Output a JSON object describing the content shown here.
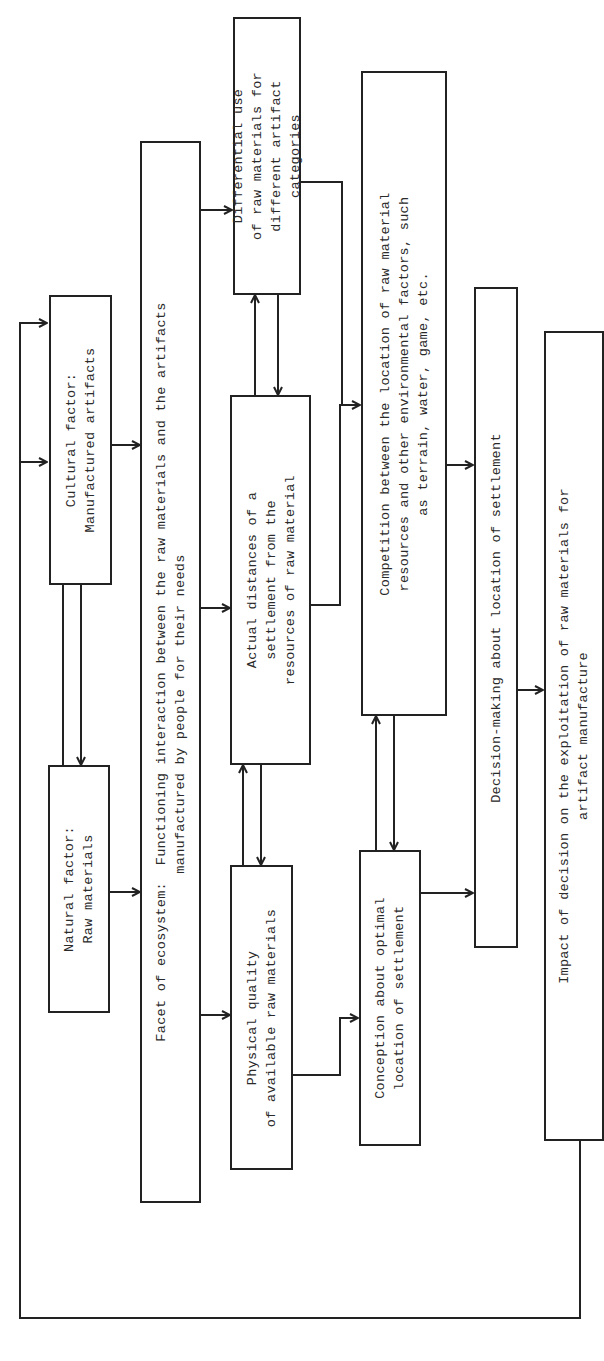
{
  "diagram": {
    "orientation": "rotated-90-ccw",
    "boxes": {
      "natural": {
        "label": "Natural factor:\nRaw materials"
      },
      "cultural": {
        "label": "Cultural factor:\nManufactured artifacts"
      },
      "facet": {
        "label": "Facet of ecosystem:  Functioning interaction between the raw materials and the artifacts\n                    manufactured by people for their needs"
      },
      "physical": {
        "label": "Physical quality\nof available raw materials"
      },
      "distances": {
        "label": "Actual distances of a\nsettlement from the\nresources of raw material"
      },
      "differential": {
        "label": "Differential use\nof raw materials for\ndifferent artifact\ncategories"
      },
      "conception": {
        "label": "Conception about optimal\nlocation of settlement"
      },
      "competition": {
        "label": "Competition between the location of raw material\nresources and other environmental factors, such\nas terrain, water, game, etc."
      },
      "decision": {
        "label": "Decision-making about location of settlement"
      },
      "impact": {
        "label": "Impact of decision on the exploitation of raw materials for\nartifact manufacture"
      }
    },
    "edges": [
      {
        "from": "natural",
        "to": "cultural",
        "type": "bidirectional"
      },
      {
        "from": "natural",
        "to": "facet"
      },
      {
        "from": "cultural",
        "to": "facet"
      },
      {
        "from": "facet",
        "to": "physical"
      },
      {
        "from": "facet",
        "to": "distances"
      },
      {
        "from": "facet",
        "to": "differential"
      },
      {
        "from": "physical",
        "to": "distances",
        "type": "bidirectional"
      },
      {
        "from": "distances",
        "to": "differential",
        "type": "bidirectional"
      },
      {
        "from": "physical",
        "to": "conception"
      },
      {
        "from": "distances",
        "to": "competition"
      },
      {
        "from": "differential",
        "to": "competition"
      },
      {
        "from": "conception",
        "to": "competition",
        "type": "bidirectional"
      },
      {
        "from": "conception",
        "to": "decision"
      },
      {
        "from": "competition",
        "to": "decision"
      },
      {
        "from": "decision",
        "to": "impact"
      },
      {
        "from": "impact",
        "to": [
          "natural",
          "cultural"
        ],
        "type": "feedback"
      }
    ]
  },
  "page": {
    "number": ""
  }
}
